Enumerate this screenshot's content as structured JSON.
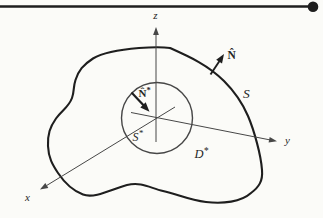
{
  "figure": {
    "colors": {
      "paper": "#fbfbf8",
      "ink": "#1e1e1e",
      "axis": "#474747"
    },
    "diagram": {
      "axes": {
        "x": {
          "label": "x"
        },
        "y": {
          "label": "y"
        },
        "z": {
          "label": "z"
        }
      },
      "outer_surface": {
        "label": "S"
      },
      "inner_surface": {
        "label": "S",
        "superscript": "*"
      },
      "region": {
        "label": "D",
        "superscript": "*"
      },
      "outer_normal": {
        "label": "N̂"
      },
      "inner_normal": {
        "label": "N̂",
        "superscript": "*"
      }
    }
  }
}
